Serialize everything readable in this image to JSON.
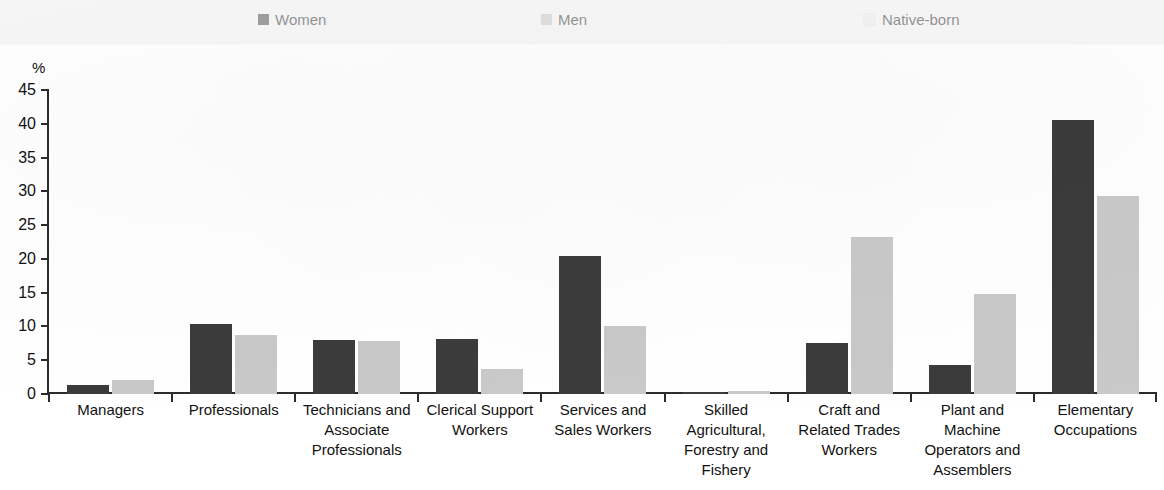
{
  "legend": {
    "items": [
      {
        "label": "Women",
        "color": "#3b3b3b",
        "name": "legend-women"
      },
      {
        "label": "Men",
        "color": "#c9c9c9",
        "name": "legend-men"
      },
      {
        "label": "Native-born",
        "color": "#f4f4f4",
        "name": "legend-native-born"
      }
    ]
  },
  "axis": {
    "unit": "%",
    "y_ticks": [
      "45",
      "40",
      "35",
      "30",
      "25",
      "20",
      "15",
      "10",
      "5",
      "0"
    ]
  },
  "chart_data": {
    "type": "bar",
    "title": "",
    "xlabel": "",
    "ylabel": "%",
    "ylim": [
      0,
      45
    ],
    "ytick_step": 5,
    "grid": false,
    "legend_position": "top",
    "categories": [
      "Managers",
      "Professionals",
      "Technicians and Associate Professionals",
      "Clerical Support Workers",
      "Services and Sales Workers",
      "Skilled Agricultural, Forestry and Fishery",
      "Craft and Related Trades Workers",
      "Plant and Machine Operators and Assemblers",
      "Elementary Occupations"
    ],
    "category_lines": [
      [
        "Managers"
      ],
      [
        "Professionals"
      ],
      [
        "Technicians and",
        "Associate",
        "Professionals"
      ],
      [
        "Clerical Support",
        "Workers"
      ],
      [
        "Services and",
        "Sales Workers"
      ],
      [
        "Skilled",
        "Agricultural,",
        "Forestry and",
        "Fishery"
      ],
      [
        "Craft and",
        "Related Trades",
        "Workers"
      ],
      [
        "Plant and",
        "Machine",
        "Operators and",
        "Assemblers"
      ],
      [
        "Elementary",
        "Occupations"
      ]
    ],
    "series": [
      {
        "name": "Women",
        "color": "#3b3b3b",
        "values": [
          1.3,
          10.3,
          8.0,
          8.1,
          20.5,
          0.3,
          7.5,
          4.3,
          40.5
        ]
      },
      {
        "name": "Men",
        "color": "#c9c9c9",
        "values": [
          2.1,
          8.8,
          7.8,
          3.7,
          10.1,
          0.5,
          23.2,
          14.8,
          29.3
        ]
      }
    ]
  }
}
